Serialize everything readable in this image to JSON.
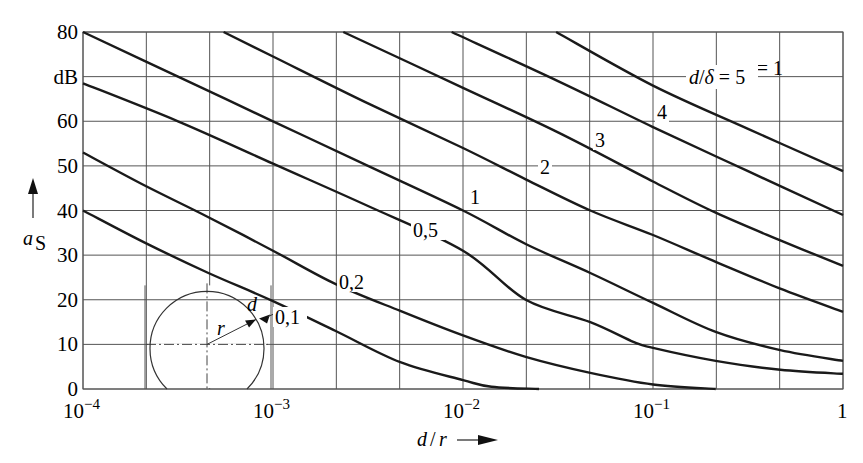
{
  "chart_data": {
    "type": "line",
    "title": "",
    "xlabel": "d/r",
    "ylabel": "a_S",
    "yunit": "dB",
    "xscale": "log",
    "xlim": [
      0.0001,
      1
    ],
    "ylim": [
      0,
      80
    ],
    "grid": true,
    "x_ticks": [
      {
        "value": -4,
        "base": "10",
        "exp": "−4"
      },
      {
        "value": -3,
        "base": "10",
        "exp": "−3"
      },
      {
        "value": -2,
        "base": "10",
        "exp": "−2"
      },
      {
        "value": -1,
        "base": "10",
        "exp": "−1"
      },
      {
        "value": 0,
        "base": "1",
        "exp": ""
      }
    ],
    "y_ticks": [
      {
        "value": 0,
        "label": "0"
      },
      {
        "value": 10,
        "label": "10"
      },
      {
        "value": 20,
        "label": "20"
      },
      {
        "value": 30,
        "label": "30"
      },
      {
        "value": 40,
        "label": "40"
      },
      {
        "value": 50,
        "label": "50"
      },
      {
        "value": 60,
        "label": "60"
      },
      {
        "value": 70,
        "label": "dB"
      },
      {
        "value": 80,
        "label": "80"
      }
    ],
    "annotation_mu": "μr = 1",
    "series_note": "x values are log10(d/r); y values are a_S in dB",
    "series": [
      {
        "name": "d/δ = 0,1",
        "label": "0,1",
        "points": [
          [
            -4,
            40
          ],
          [
            -3.67,
            32.7
          ],
          [
            -3.34,
            26
          ],
          [
            -3.0,
            19.7
          ],
          [
            -2.67,
            13
          ],
          [
            -2.33,
            6
          ],
          [
            -2.0,
            2
          ],
          [
            -1.85,
            0.5
          ],
          [
            -1.6,
            0
          ]
        ]
      },
      {
        "name": "d/δ = 0,2",
        "label": "0,2",
        "points": [
          [
            -4,
            53
          ],
          [
            -3.67,
            45.5
          ],
          [
            -3.34,
            38.5
          ],
          [
            -3.0,
            31
          ],
          [
            -2.67,
            23.5
          ],
          [
            -2.33,
            17.5
          ],
          [
            -2.0,
            12
          ],
          [
            -1.67,
            7.2
          ],
          [
            -1.33,
            3.6
          ],
          [
            -1.0,
            1
          ],
          [
            -0.67,
            0
          ]
        ]
      },
      {
        "name": "d/δ = 0,5",
        "label": "0,5",
        "points": [
          [
            -4,
            68.5
          ],
          [
            -3.5,
            60
          ],
          [
            -3.0,
            50.5
          ],
          [
            -2.5,
            41
          ],
          [
            -2.0,
            31
          ],
          [
            -1.67,
            20
          ],
          [
            -1.33,
            15
          ],
          [
            -1.1,
            10.5
          ],
          [
            -1.0,
            9.2
          ],
          [
            -0.67,
            6.3
          ],
          [
            -0.33,
            4.3
          ],
          [
            0,
            3.4
          ]
        ]
      },
      {
        "name": "d/δ = 1",
        "label": "1",
        "points": [
          [
            -4,
            80
          ],
          [
            -3.5,
            70
          ],
          [
            -3.0,
            60
          ],
          [
            -2.5,
            50
          ],
          [
            -2.0,
            40
          ],
          [
            -1.67,
            32.5
          ],
          [
            -1.33,
            26
          ],
          [
            -1.0,
            19.3
          ],
          [
            -0.67,
            12.8
          ],
          [
            -0.33,
            8.7
          ],
          [
            0,
            6.3
          ]
        ]
      },
      {
        "name": "d/δ = 2",
        "label": "2",
        "points": [
          [
            -3.26,
            80
          ],
          [
            -3.0,
            74.5
          ],
          [
            -2.5,
            64
          ],
          [
            -2.0,
            54
          ],
          [
            -1.67,
            47
          ],
          [
            -1.33,
            40
          ],
          [
            -1.0,
            34.5
          ],
          [
            -0.67,
            28.5
          ],
          [
            -0.33,
            22.5
          ],
          [
            0,
            17.3
          ]
        ]
      },
      {
        "name": "d/δ = 3",
        "label": "3",
        "points": [
          [
            -2.63,
            80
          ],
          [
            -2.0,
            67.5
          ],
          [
            -1.5,
            57.5
          ],
          [
            -1.0,
            46.5
          ],
          [
            -0.67,
            39.5
          ],
          [
            -0.33,
            33.3
          ],
          [
            0,
            27.6
          ]
        ]
      },
      {
        "name": "d/δ = 4",
        "label": "4",
        "points": [
          [
            -2.06,
            80
          ],
          [
            -1.5,
            69
          ],
          [
            -1.0,
            58.7
          ],
          [
            -0.5,
            48.8
          ],
          [
            0,
            39
          ]
        ]
      },
      {
        "name": "d/δ = 5",
        "label": "d/δ = 5",
        "points": [
          [
            -1.51,
            80
          ],
          [
            -1.0,
            68
          ],
          [
            -0.5,
            58.3
          ],
          [
            0,
            48.8
          ]
        ]
      }
    ],
    "curve_labels": [
      {
        "text": "0,1",
        "x": 275,
        "y": 324
      },
      {
        "text": "0,2",
        "x": 339,
        "y": 289
      },
      {
        "text": "0,5",
        "x": 413,
        "y": 237
      },
      {
        "text": "1",
        "x": 470,
        "y": 204
      },
      {
        "text": "2",
        "x": 540,
        "y": 174
      },
      {
        "text": "3",
        "x": 595,
        "y": 147
      },
      {
        "text": "4",
        "x": 657,
        "y": 119
      }
    ],
    "inset": {
      "description": "cross-section of cylindrical shield",
      "radius_label": "r",
      "thickness_label": "d"
    }
  }
}
